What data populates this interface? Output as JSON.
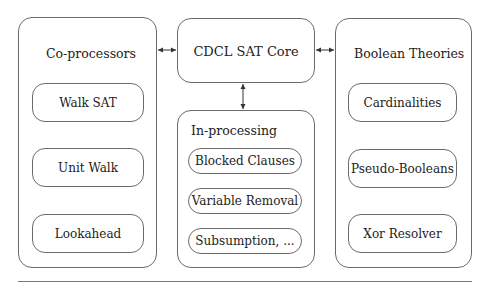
{
  "diagram": {
    "coprocessors": {
      "title": "Co-processors",
      "items": [
        "Walk SAT",
        "Unit Walk",
        "Lookahead"
      ]
    },
    "core": {
      "title": "CDCL SAT Core"
    },
    "inprocessing": {
      "title": "In-processing",
      "items": [
        "Blocked Clauses",
        "Variable Removal",
        "Subsumption, ..."
      ]
    },
    "theories": {
      "title": "Boolean Theories",
      "items": [
        "Cardinalities",
        "Pseudo-Booleans",
        "Xor Resolver"
      ]
    },
    "connections": [
      {
        "from": "Co-processors",
        "to": "CDCL SAT Core",
        "type": "bidirectional"
      },
      {
        "from": "CDCL SAT Core",
        "to": "Boolean Theories",
        "type": "bidirectional"
      },
      {
        "from": "CDCL SAT Core",
        "to": "In-processing",
        "type": "bidirectional"
      }
    ],
    "colors": {
      "stroke": "#6a6a6a",
      "text": "#222222",
      "background": "#ffffff"
    }
  }
}
